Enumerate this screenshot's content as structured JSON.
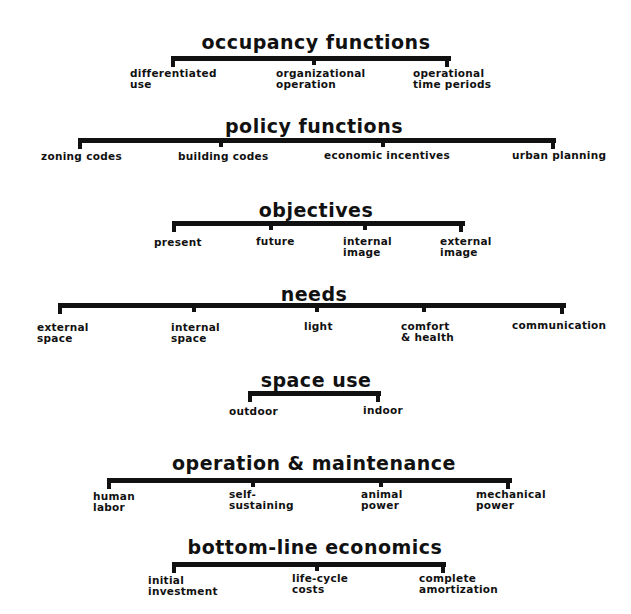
{
  "groups": [
    {
      "title": "occupancy functions",
      "title_x": 316,
      "title_y": 33,
      "bar": {
        "x1": 173,
        "x2": 451,
        "y": 56
      },
      "items": [
        {
          "label": "differentiated\nuse",
          "tick_x": 173,
          "x": 130,
          "y": 68
        },
        {
          "label": "organizational\noperation",
          "tick_x": 314,
          "x": 276,
          "y": 68
        },
        {
          "label": "operational\ntime periods",
          "tick_x": 447,
          "x": 413,
          "y": 68
        }
      ]
    },
    {
      "title": "policy functions",
      "title_x": 314,
      "title_y": 117,
      "bar": {
        "x1": 80,
        "x2": 556,
        "y": 138
      },
      "items": [
        {
          "label": "zoning codes",
          "tick_x": 80,
          "x": 41,
          "y": 151
        },
        {
          "label": "building codes",
          "tick_x": 221,
          "x": 178,
          "y": 151
        },
        {
          "label": "economic incentives",
          "tick_x": 383,
          "x": 324,
          "y": 150
        },
        {
          "label": "urban planning",
          "tick_x": 553,
          "x": 512,
          "y": 150
        }
      ]
    },
    {
      "title": "objectives",
      "title_x": 316,
      "title_y": 201,
      "bar": {
        "x1": 174,
        "x2": 465,
        "y": 221
      },
      "items": [
        {
          "label": "present",
          "tick_x": 174,
          "x": 154,
          "y": 237
        },
        {
          "label": "future",
          "tick_x": 271,
          "x": 256,
          "y": 236
        },
        {
          "label": "internal\nimage",
          "tick_x": 365,
          "x": 343,
          "y": 236
        },
        {
          "label": "external\nimage",
          "tick_x": 461,
          "x": 440,
          "y": 236
        }
      ]
    },
    {
      "title": "needs",
      "title_x": 314,
      "title_y": 285,
      "bar": {
        "x1": 60,
        "x2": 566,
        "y": 303
      },
      "items": [
        {
          "label": "external\nspace",
          "tick_x": 60,
          "x": 37,
          "y": 322
        },
        {
          "label": "internal\nspace",
          "tick_x": 194,
          "x": 171,
          "y": 322
        },
        {
          "label": "light",
          "tick_x": 317,
          "x": 304,
          "y": 321
        },
        {
          "label": "comfort\n& health",
          "tick_x": 424,
          "x": 401,
          "y": 321
        },
        {
          "label": "communication",
          "tick_x": 562,
          "x": 512,
          "y": 320
        }
      ]
    },
    {
      "title": "space use",
      "title_x": 316,
      "title_y": 371,
      "bar": {
        "x1": 250,
        "x2": 381,
        "y": 391
      },
      "items": [
        {
          "label": "outdoor",
          "tick_x": 250,
          "x": 229,
          "y": 406
        },
        {
          "label": "indoor",
          "tick_x": 378,
          "x": 363,
          "y": 405
        }
      ]
    },
    {
      "title": "operation & maintenance",
      "title_x": 314,
      "title_y": 454,
      "bar": {
        "x1": 109,
        "x2": 512,
        "y": 478
      },
      "items": [
        {
          "label": "human\nlabor",
          "tick_x": 109,
          "x": 93,
          "y": 491
        },
        {
          "label": "self-\nsustaining",
          "tick_x": 253,
          "x": 229,
          "y": 489
        },
        {
          "label": "animal\npower",
          "tick_x": 381,
          "x": 361,
          "y": 489
        },
        {
          "label": "mechanical\npower",
          "tick_x": 508,
          "x": 476,
          "y": 489
        }
      ]
    },
    {
      "title": "bottom-line economics",
      "title_x": 315,
      "title_y": 538,
      "bar": {
        "x1": 174,
        "x2": 446,
        "y": 562
      },
      "items": [
        {
          "label": "initial\ninvestment",
          "tick_x": 174,
          "x": 148,
          "y": 575
        },
        {
          "label": "life-cycle\ncosts",
          "tick_x": 317,
          "x": 292,
          "y": 573
        },
        {
          "label": "complete\namortization",
          "tick_x": 443,
          "x": 419,
          "y": 573
        }
      ]
    }
  ]
}
